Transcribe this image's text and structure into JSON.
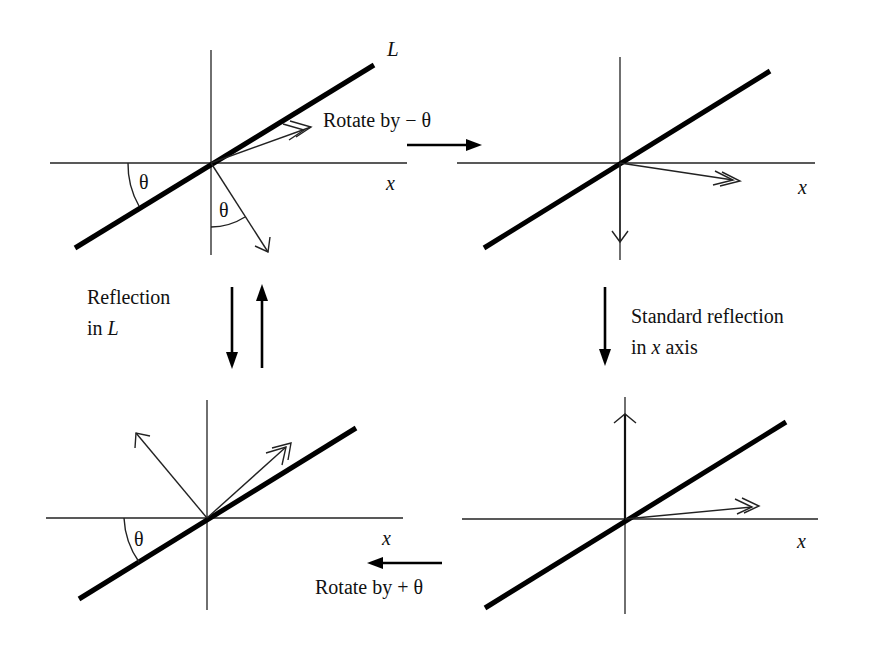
{
  "diagram": {
    "panels": {
      "top_left": {
        "line_label": "L",
        "axis_label": "x",
        "angle_label_axis": "θ",
        "angle_label_vector": "θ"
      },
      "top_right": {
        "axis_label": "x"
      },
      "bottom_left": {
        "axis_label": "x",
        "angle_label": "θ"
      },
      "bottom_right": {
        "axis_label": "x"
      }
    },
    "transitions": {
      "top": {
        "label": "Rotate by − θ",
        "direction": "right"
      },
      "right": {
        "label_line1": "Standard reflection",
        "label_line2_prefix": "in ",
        "label_line2_var": "x",
        "label_line2_suffix": " axis",
        "direction": "down"
      },
      "bottom": {
        "label": "Rotate by + θ",
        "direction": "left"
      },
      "left": {
        "label_line1": "Reflection",
        "label_line2_prefix": "in ",
        "label_line2_var": "L",
        "direction": "down-and-up"
      }
    },
    "colors": {
      "ink": "#000000",
      "background": "#ffffff"
    }
  }
}
